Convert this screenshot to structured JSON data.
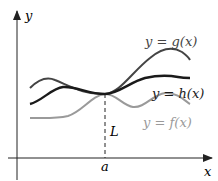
{
  "figure": {
    "axes": {
      "x_label": "x",
      "y_label": "y"
    },
    "point": {
      "x_label": "a",
      "y_label": "L"
    },
    "curves": [
      {
        "id": "g",
        "label": "y = g(x)",
        "color": "#444444"
      },
      {
        "id": "h",
        "label": "y = h(x)",
        "color": "#1a1a1a"
      },
      {
        "id": "f",
        "label": "y = f(x)",
        "color": "#9a9a9a"
      }
    ],
    "labels": {
      "g": "y = g(x)",
      "h": "y = h(x)",
      "f": "y = f(x)",
      "L": "L",
      "a": "a",
      "x": "x",
      "y": "y"
    }
  }
}
